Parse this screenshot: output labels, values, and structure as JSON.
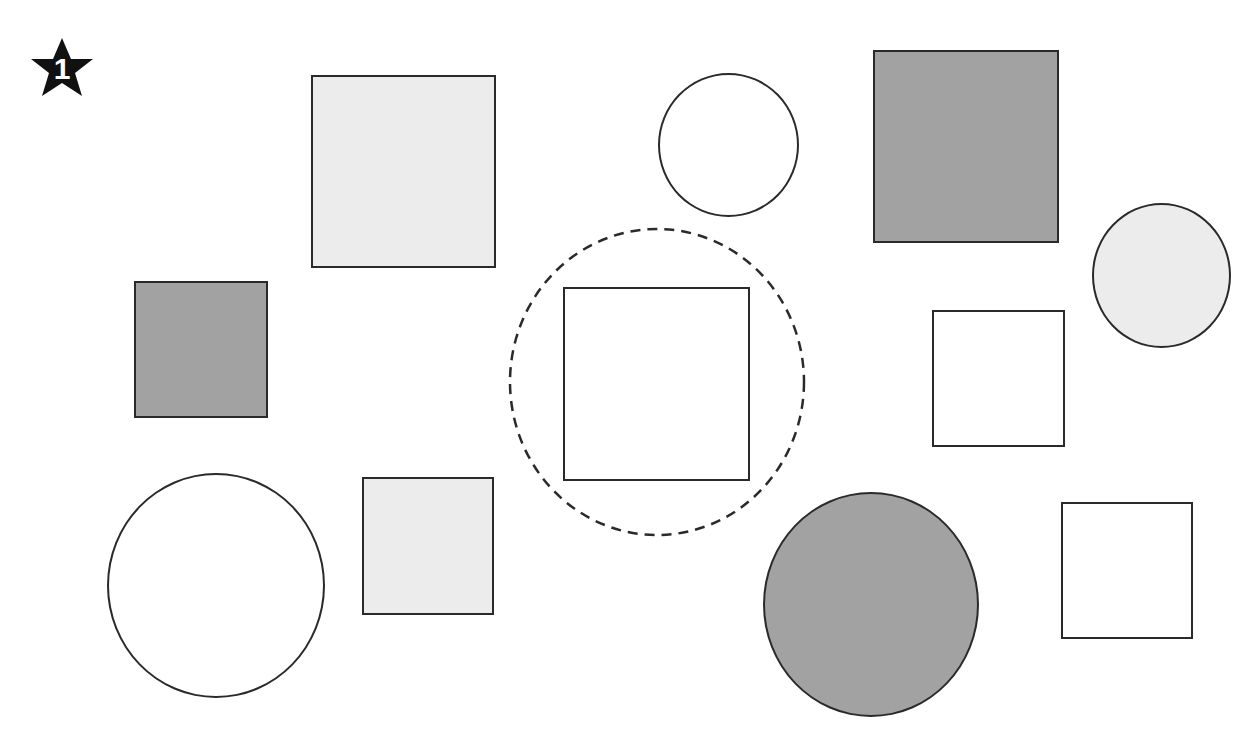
{
  "badge": {
    "number": "1",
    "shape": "star",
    "color": "#111111"
  },
  "colors": {
    "outline": "#2a2a2a",
    "white": "#ffffff",
    "light_gray": "#ececec",
    "dark_gray": "#a2a2a2"
  },
  "highlight": {
    "type": "dashed-circle",
    "encloses": "white-square-center"
  },
  "shapes": [
    {
      "id": "light-square-top",
      "type": "square",
      "fill": "light_gray"
    },
    {
      "id": "white-circle-top",
      "type": "circle",
      "fill": "white"
    },
    {
      "id": "dark-square-top-right",
      "type": "square",
      "fill": "dark_gray"
    },
    {
      "id": "light-circle-right",
      "type": "circle",
      "fill": "light_gray"
    },
    {
      "id": "dark-square-left",
      "type": "square",
      "fill": "dark_gray"
    },
    {
      "id": "white-square-center",
      "type": "square",
      "fill": "white"
    },
    {
      "id": "white-square-right",
      "type": "square",
      "fill": "white"
    },
    {
      "id": "white-circle-bottom-left",
      "type": "circle",
      "fill": "white"
    },
    {
      "id": "light-square-bottom",
      "type": "square",
      "fill": "light_gray"
    },
    {
      "id": "dark-circle-bottom",
      "type": "circle",
      "fill": "dark_gray"
    },
    {
      "id": "white-square-bottom-right",
      "type": "square",
      "fill": "white"
    }
  ]
}
